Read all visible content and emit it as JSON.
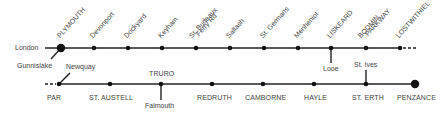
{
  "diagram": {
    "type": "railway-route-map",
    "colors": {
      "line": "#222222",
      "text": "#444444",
      "background": "#ffffff"
    },
    "top_line": {
      "origin_label": "London",
      "continuation": "dashed-east",
      "stations": [
        {
          "name": "PLYMOUTH",
          "x": 61,
          "major": true
        },
        {
          "name": "Devonport",
          "x": 94
        },
        {
          "name": "Dockyard",
          "x": 128
        },
        {
          "name": "Keyham",
          "x": 162
        },
        {
          "name": "St. Budeaux",
          "name2": "Ferry Rd",
          "x": 196
        },
        {
          "name": "Saltash",
          "x": 230
        },
        {
          "name": "St. Germans",
          "x": 264
        },
        {
          "name": "Menheniot",
          "x": 298
        },
        {
          "name": "LISKEARD",
          "x": 331
        },
        {
          "name": "BODMIN",
          "name2": "PARKWAY",
          "x": 366
        },
        {
          "name": "LOSTWITHIEL",
          "x": 400
        }
      ],
      "branches": [
        {
          "from": "PLYMOUTH",
          "to": "Gunnislake"
        },
        {
          "from": "LISKEARD",
          "to": "Looe"
        }
      ]
    },
    "bottom_line": {
      "continuation": "dashed-west",
      "stations": [
        {
          "name": "PAR",
          "x": 59
        },
        {
          "name": "ST. AUSTELL",
          "x": 110
        },
        {
          "name": "TRURO",
          "x": 161
        },
        {
          "name": "REDRUTH",
          "x": 212
        },
        {
          "name": "CAMBORNE",
          "x": 263
        },
        {
          "name": "HAYLE",
          "x": 314
        },
        {
          "name": "ST. ERTH",
          "x": 366
        },
        {
          "name": "PENZANCE",
          "x": 415,
          "major": true
        }
      ],
      "branches": [
        {
          "from": "PAR",
          "to": "Newquay"
        },
        {
          "from": "TRURO",
          "to": "Falmouth"
        },
        {
          "from": "ST. ERTH",
          "to": "St. Ives"
        }
      ]
    },
    "labels": {
      "london": "London",
      "gunnislake": "Gunnislake",
      "newquay": "Newquay",
      "looe": "Looe",
      "st_ives": "St. Ives",
      "falmouth": "Falmouth",
      "truro": "TRURO",
      "par": "PAR",
      "st_austell": "ST. AUSTELL",
      "redruth": "REDRUTH",
      "camborne": "CAMBORNE",
      "hayle": "HAYLE",
      "st_erth": "ST. ERTH",
      "penzance": "PENZANCE",
      "plymouth": "PLYMOUTH",
      "devonport": "Devonport",
      "dockyard": "Dockyard",
      "keyham": "Keyham",
      "st_budeaux_1": "St. Budeaux",
      "st_budeaux_2": "Ferry Rd",
      "saltash": "Saltash",
      "st_germans": "St. Germans",
      "menheniot": "Menheniot",
      "liskeard": "LISKEARD",
      "bodmin_1": "BODMIN",
      "bodmin_2": "PARKWAY",
      "lostwithiel": "LOSTWITHIEL"
    }
  }
}
